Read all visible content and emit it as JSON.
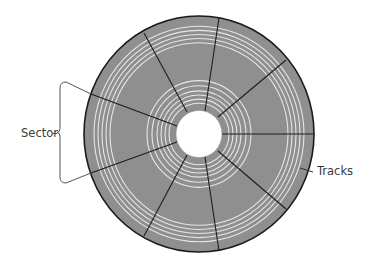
{
  "diagram": {
    "type": "disk-platter",
    "labels": {
      "sector": "Sector",
      "tracks": "Tracks"
    },
    "colors": {
      "background": "#ffffff",
      "disk_fill": "#8f8f8f",
      "track_rings": "#e6e6e6",
      "sector_lines": "#1e1e1e",
      "rim": "#1a1a1a",
      "hub": "#ffffff",
      "annotation": "#555555",
      "label_text": "#3a3a3a"
    },
    "disk": {
      "cx": 199,
      "cy": 134,
      "rx": 115,
      "ry": 118
    },
    "hub": {
      "r": 23
    },
    "sector_count": 9,
    "sector_lines": [
      {
        "x1": 187,
        "y1": 112,
        "x2": 144,
        "y2": 33
      },
      {
        "x1": 205,
        "y1": 111,
        "x2": 219,
        "y2": 18
      },
      {
        "x1": 218,
        "y1": 117,
        "x2": 286,
        "y2": 60
      },
      {
        "x1": 222,
        "y1": 134,
        "x2": 314,
        "y2": 134
      },
      {
        "x1": 218,
        "y1": 151,
        "x2": 286,
        "y2": 209
      },
      {
        "x1": 205,
        "y1": 157,
        "x2": 219,
        "y2": 251
      },
      {
        "x1": 187,
        "y1": 155,
        "x2": 144,
        "y2": 236
      },
      {
        "x1": 177,
        "y1": 142,
        "x2": 91,
        "y2": 173
      },
      {
        "x1": 177,
        "y1": 126,
        "x2": 91,
        "y2": 94
      }
    ],
    "inner_tracks_r": [
      30,
      34,
      38,
      42,
      47,
      52
    ],
    "outer_tracks_r": [
      89,
      93,
      97,
      101,
      105
    ],
    "sector_bracket": {
      "x": 60,
      "y_top": 82,
      "y_bottom": 183,
      "pointer_top": {
        "x1": 66,
        "y1": 82,
        "x2": 91,
        "y2": 94
      },
      "pointer_bottom": {
        "x1": 66,
        "y1": 183,
        "x2": 91,
        "y2": 173
      }
    },
    "tracks_pointer": {
      "x1": 300,
      "y1": 168,
      "x2": 313,
      "y2": 172
    }
  }
}
